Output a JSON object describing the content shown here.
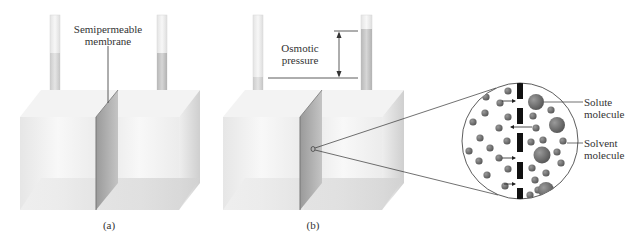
{
  "figure": {
    "panel_a": {
      "caption": "(a)",
      "membrane_label": [
        "Semipermeable",
        "membrane"
      ]
    },
    "panel_b": {
      "caption": "(b)",
      "pressure_label": [
        "Osmotic",
        "pressure"
      ]
    },
    "magnified_view": {
      "solute_label": [
        "Solute",
        "molecule"
      ],
      "solvent_label": [
        "Solvent",
        "molecule"
      ]
    },
    "colors": {
      "molecule": "#6f6f6f",
      "membrane_block": "#111111",
      "liquid_tube": "#c9c9c9",
      "box_face": "#f1f1f1",
      "membrane_panel": "#a8a8a8",
      "line": "#333333"
    }
  }
}
